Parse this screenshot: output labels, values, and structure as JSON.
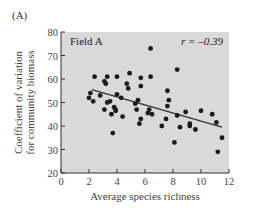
{
  "chart_data": {
    "type": "scatter",
    "panel_label": "(A)",
    "title": "Field A",
    "annotation": "r = –0.39",
    "xlabel": "Average species richness",
    "ylabel_lines": [
      "Coefficient of variation",
      "for community biomass"
    ],
    "xlim": [
      0,
      12
    ],
    "ylim": [
      20,
      80
    ],
    "xticks": [
      0,
      2,
      4,
      6,
      8,
      10,
      12
    ],
    "yticks": [
      20,
      30,
      40,
      50,
      60,
      70,
      80
    ],
    "grid": false,
    "background": "#d9d9d9",
    "point_color": "#1a1a1a",
    "line_color": "#333333",
    "points": [
      [
        2.0,
        52
      ],
      [
        2.1,
        54
      ],
      [
        2.3,
        50.5
      ],
      [
        2.4,
        61
      ],
      [
        2.8,
        53
      ],
      [
        3.1,
        59
      ],
      [
        3.1,
        47
      ],
      [
        3.2,
        58
      ],
      [
        3.3,
        50
      ],
      [
        3.3,
        61
      ],
      [
        3.5,
        50.5
      ],
      [
        3.6,
        45
      ],
      [
        3.7,
        37
      ],
      [
        3.8,
        48
      ],
      [
        3.9,
        46.5
      ],
      [
        3.9,
        47
      ],
      [
        4.0,
        61
      ],
      [
        4.0,
        53.5
      ],
      [
        4.3,
        52
      ],
      [
        4.4,
        44
      ],
      [
        4.7,
        58
      ],
      [
        4.8,
        56
      ],
      [
        4.9,
        62.5
      ],
      [
        5.3,
        49.5
      ],
      [
        5.4,
        47
      ],
      [
        5.5,
        51
      ],
      [
        5.6,
        41
      ],
      [
        5.7,
        60.5
      ],
      [
        5.7,
        57
      ],
      [
        5.7,
        43
      ],
      [
        6.2,
        45.5
      ],
      [
        6.3,
        47
      ],
      [
        6.4,
        61
      ],
      [
        6.4,
        73
      ],
      [
        6.5,
        45
      ],
      [
        7.2,
        40
      ],
      [
        7.5,
        43
      ],
      [
        7.6,
        48.5
      ],
      [
        7.6,
        55
      ],
      [
        7.7,
        51
      ],
      [
        8.1,
        33
      ],
      [
        8.3,
        44.5
      ],
      [
        8.3,
        64
      ],
      [
        8.5,
        39.5
      ],
      [
        8.9,
        46
      ],
      [
        9.2,
        41
      ],
      [
        9.2,
        40
      ],
      [
        9.6,
        38.5
      ],
      [
        10.0,
        46.5
      ],
      [
        10.8,
        45
      ],
      [
        11.1,
        41.5
      ],
      [
        11.2,
        29
      ],
      [
        11.5,
        35
      ]
    ],
    "regression_line": {
      "x1": 2.2,
      "y1": 55.5,
      "x2": 11.5,
      "y2": 39.5
    }
  }
}
